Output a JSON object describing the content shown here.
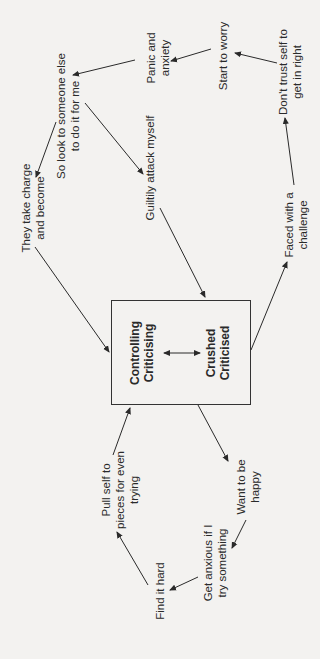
{
  "diagram": {
    "type": "cycle-diagram",
    "orientation": "rotated -90 degrees",
    "center_box": {
      "left_label": [
        "Controlling",
        "Criticising"
      ],
      "right_label": [
        "Crushed",
        "Criticised"
      ],
      "connector": "double-headed arrow"
    },
    "nodes": {
      "panic": [
        "Panic and",
        "anxiety"
      ],
      "worry": [
        "Start to worry"
      ],
      "dont_trust": [
        "Don't trust self to",
        "get in right"
      ],
      "look_someone": [
        "So look to someone else",
        "to do it for me"
      ],
      "guiltily": [
        "Guiltily attack myself"
      ],
      "they_take": [
        "They take charge",
        "and become"
      ],
      "faced": [
        "Faced with a",
        "challenge"
      ],
      "pull_self": [
        "Pull self to",
        "pieces for even",
        "trying"
      ],
      "want_happy": [
        "Want to be",
        "happy"
      ],
      "get_anxious": [
        "Get anxious if I",
        "try something"
      ],
      "find_hard": [
        "Find it hard"
      ]
    },
    "edges": [
      {
        "from": "Crushed/Criticised box",
        "to": "Faced with a challenge"
      },
      {
        "from": "Faced with a challenge",
        "to": "Don't trust self to get in right"
      },
      {
        "from": "Don't trust self to get in right",
        "to": "Start to worry"
      },
      {
        "from": "Start to worry",
        "to": "Panic and anxiety"
      },
      {
        "from": "Panic and anxiety",
        "to": "So look to someone else to do it for me"
      },
      {
        "from": "So look to someone else to do it for me",
        "to": "They take charge and become"
      },
      {
        "from": "So look to someone else to do it for me",
        "to": "Guiltily attack myself"
      },
      {
        "from": "They take charge and become",
        "to": "box"
      },
      {
        "from": "Guiltily attack myself",
        "to": "box"
      },
      {
        "from": "box",
        "to": "Want to be happy"
      },
      {
        "from": "Want to be happy",
        "to": "Get anxious if I try something"
      },
      {
        "from": "Get anxious if I try something",
        "to": "Find it hard"
      },
      {
        "from": "Find it hard",
        "to": "Pull self to pieces for even trying"
      },
      {
        "from": "Pull self to pieces for even trying",
        "to": "box"
      }
    ],
    "colors": {
      "background": "#f3f2f0",
      "ink": "#2a2a2a"
    }
  }
}
